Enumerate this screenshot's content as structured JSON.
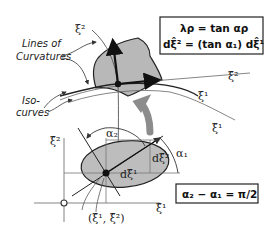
{
  "diagram": {
    "labels": {
      "lines_of_curvatures_1": "Lines of",
      "lines_of_curvatures_2": "Curvatures",
      "iso_curves_1": "Iso-",
      "iso_curves_2": "curves",
      "xi2_top": "ξ²",
      "xi_hat2_right": "ξ̂²",
      "xi1_right": "ξ¹",
      "xi_hat1_right": "ξ̂¹",
      "alpha2": "α₂",
      "alpha1": "α₁",
      "d_xi_hat2": "dξ̂²",
      "d_xi_hat1": "dξ̂¹",
      "xi_hat2_axis": "ξ̂²",
      "xi_hat1_axis": "ξ̂¹",
      "origin": "o",
      "point": "(ξ̂¹, ξ̂²)"
    },
    "formula_box_top": {
      "line1": "λρ = tan αρ",
      "line2": "dξ̂² = (tan α₁) dξ̂¹"
    },
    "formula_box_bottom": {
      "text": "α₂ − α₁ = π/2"
    },
    "colors": {
      "surface_fill": "#b8b8b8",
      "ellipse_fill": "#bdbdbd",
      "stroke": "#1a1a1a",
      "arrow_gray": "#8c8c8c",
      "thin_line": "#777777"
    }
  }
}
